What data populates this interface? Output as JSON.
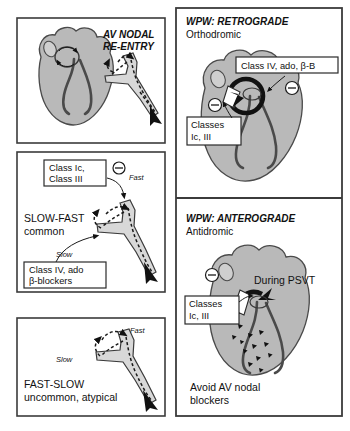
{
  "figure": {
    "title_panel1": "AV NODAL",
    "title_panel1_line2": "RE-ENTRY"
  },
  "panels": [
    {
      "id": "av-nodal-reentry",
      "heading": "AV NODAL",
      "heading_line2": "RE-ENTRY",
      "drug_boxes": [],
      "annotations": []
    },
    {
      "id": "slow-fast",
      "heading": "SLOW-FAST",
      "subheading": "common",
      "drug_box_top": {
        "line1": "Class Ic,",
        "line2": "Class III"
      },
      "drug_box_bottom": {
        "line1": "Class IV, ado",
        "line2": "β-blockers"
      },
      "pathway_fast": "Fast",
      "pathway_slow": "Slow"
    },
    {
      "id": "fast-slow",
      "heading": "FAST-SLOW",
      "subheading": "uncommon, atypical",
      "pathway_fast": "Fast",
      "pathway_slow": "Slow"
    },
    {
      "id": "wpw-retrograde",
      "heading": "WPW: RETROGRADE",
      "subheading": "Orthodromic",
      "drug_box_top": "Class IV, ado, β-B",
      "drug_box_left": {
        "line1": "Classes",
        "line2": "Ic, III"
      }
    },
    {
      "id": "wpw-anterograde",
      "heading": "WPW: ANTEROGRADE",
      "subheading": "Antidromic",
      "drug_box_left": {
        "line1": "Classes",
        "line2": "Ic, III"
      },
      "label_psvt": "During PSVT",
      "warning_line1": "Avoid AV nodal",
      "warning_line2": "blockers"
    }
  ],
  "symbols": {
    "inhibition": "circled-minus"
  },
  "colors": {
    "heart_fill": "#b9b9b9",
    "heart_light": "#cfcfcf",
    "node_fill": "#d8d8d8",
    "stroke": "#4a4a4a",
    "box_stroke": "#2a2a2a",
    "background": "#ffffff"
  },
  "footer_text": ""
}
